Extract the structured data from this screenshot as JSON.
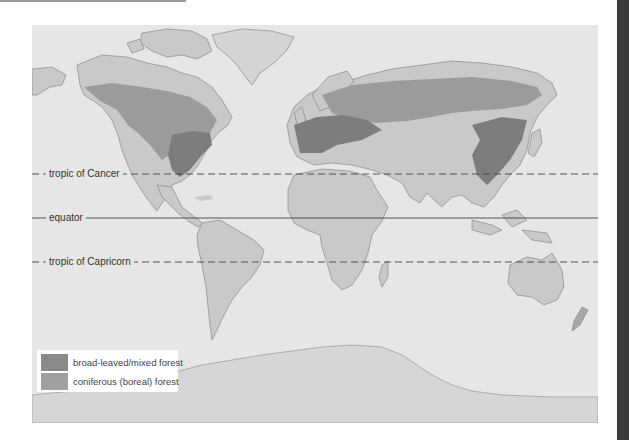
{
  "map": {
    "title": "World forest distribution",
    "colors": {
      "ocean": "#e6e6e6",
      "land": "#c9c9c9",
      "coniferous": "#9b9b9b",
      "broad_leaved": "#7d7d7d",
      "ice": "#d6d6d6"
    },
    "reference_lines": [
      {
        "id": "cancer",
        "label": "tropic of Cancer",
        "style": "dashed"
      },
      {
        "id": "equator",
        "label": "equator",
        "style": "solid"
      },
      {
        "id": "capricorn",
        "label": "tropic of Capricorn",
        "style": "dashed"
      }
    ],
    "legend": {
      "items": [
        {
          "label": "broad-leaved/mixed forest",
          "color": "#8a8a8a"
        },
        {
          "label": "coniferous (boreal) forest",
          "color": "#a0a0a0"
        }
      ]
    }
  }
}
